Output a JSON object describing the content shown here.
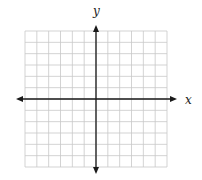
{
  "chart_data": {
    "type": "scatter",
    "title": "",
    "xlabel": "x",
    "ylabel": "y",
    "grid": true,
    "grid_cells": {
      "columns": 12,
      "rows": 12
    },
    "xlim": [
      -6,
      6
    ],
    "ylim": [
      -6,
      6
    ],
    "series": [],
    "tick_labels": {
      "x": [],
      "y": []
    },
    "axes_arrows": true
  },
  "colors": {
    "grid": "#c8c8c8",
    "axis": "#1a1a1a",
    "label": "#222222"
  },
  "layout": {
    "grid_left": 25,
    "grid_top": 31,
    "grid_right": 167,
    "grid_bottom": 167,
    "axis_x_y": 99,
    "axis_y_x": 96,
    "x_arrow_left": 16,
    "x_arrow_right": 177,
    "y_arrow_top": 25,
    "y_arrow_bottom": 174
  }
}
